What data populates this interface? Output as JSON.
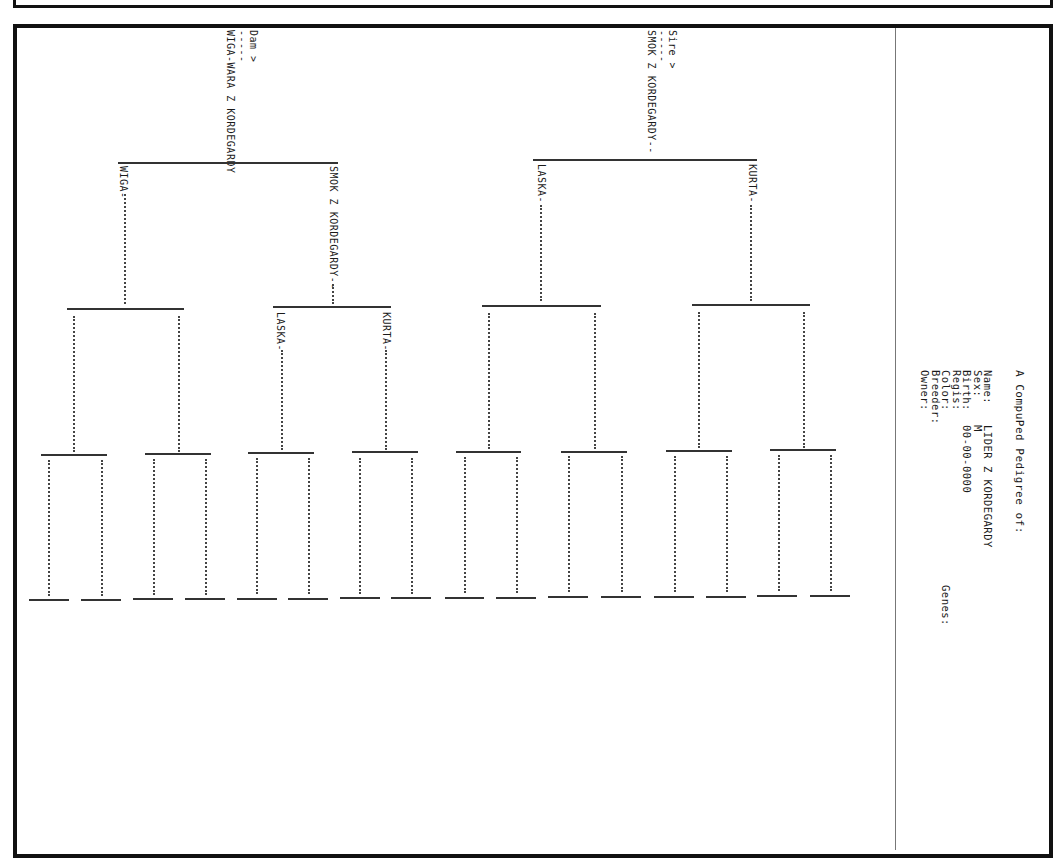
{
  "title": "A CompuPed Pedigree of:",
  "subject": {
    "fields": [
      {
        "label": "Name:",
        "value": "LIDER Z KORDEGARDY"
      },
      {
        "label": "Sex:",
        "value": "M"
      },
      {
        "label": "Birth:",
        "value": "00-00-0000"
      },
      {
        "label": "Regis:",
        "value": ""
      },
      {
        "label": "Color:",
        "value": ""
      },
      {
        "label": "Breeder:",
        "value": ""
      },
      {
        "label": "Owner:",
        "value": ""
      }
    ],
    "genes_label": "Genes:"
  },
  "pedigree": {
    "sire": {
      "marker": "Sire >",
      "dashes": "-----",
      "name": "SMOK Z KORDEGARDY--",
      "sire": {
        "name": "KURTA-"
      },
      "dam": {
        "name": "LASKA-"
      }
    },
    "dam": {
      "marker": "Dam >",
      "dashes": "-----",
      "name": "WIGA-WARA Z KORDEGARDY",
      "sire": {
        "name": "SMOK Z KORDEGARDY--",
        "sire": {
          "name": "KURTA-"
        },
        "dam": {
          "name": "LASKA-"
        }
      },
      "dam": {
        "name": "WIGA-"
      }
    }
  }
}
